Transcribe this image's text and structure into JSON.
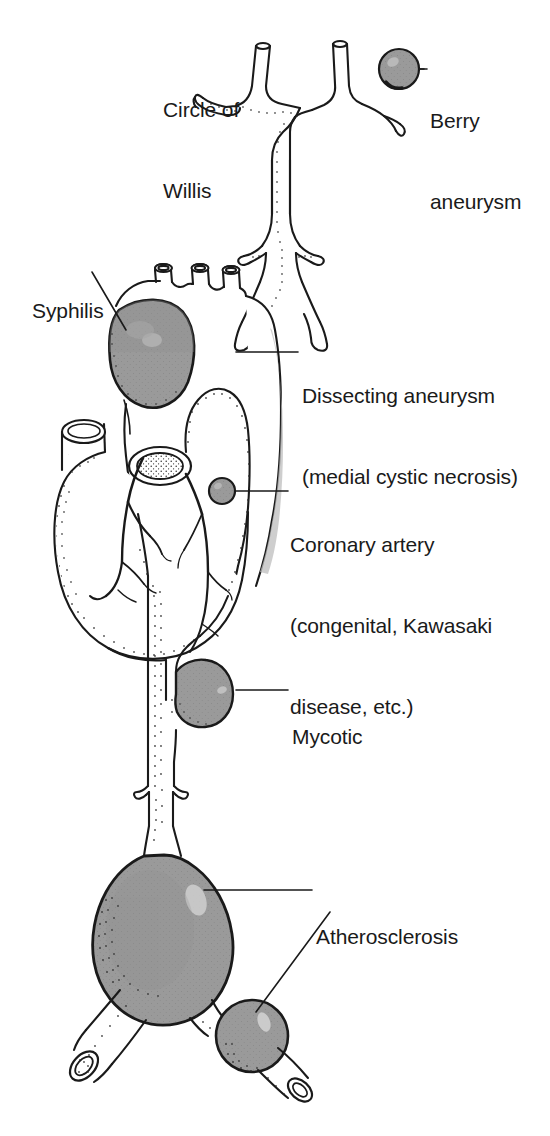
{
  "figure": {
    "background_color": "#ffffff",
    "ink_color": "#1a1a1a",
    "aneurysm_fill_color": "#9a9a9a",
    "vessel_fill_color": "#ffffff",
    "width": 550,
    "height": 1136
  },
  "labels": {
    "circle_of_willis": {
      "line1": "Circle of",
      "line2": "Willis"
    },
    "berry_aneurysm": {
      "line1": "Berry",
      "line2": "aneurysm"
    },
    "syphilis": {
      "line1": "Syphilis"
    },
    "dissecting_aneurysm": {
      "line1": "Dissecting aneurysm",
      "line2": "(medial cystic necrosis)"
    },
    "coronary_artery": {
      "line1": "Coronary artery",
      "line2": "(congenital, Kawasaki",
      "line3": "disease, etc.)"
    },
    "mycotic": {
      "line1": "Mycotic"
    },
    "atherosclerosis": {
      "line1": "Atherosclerosis"
    }
  },
  "structures": [
    {
      "name": "circle-of-willis",
      "label": "Circle of Willis",
      "shaded": false
    },
    {
      "name": "berry-aneurysm",
      "label": "Berry aneurysm",
      "shaded": true
    },
    {
      "name": "syphilitic-aortic-aneurysm",
      "label": "Syphilis",
      "shaded": true
    },
    {
      "name": "aortic-arch-dissection",
      "label": "Dissecting aneurysm (medial cystic necrosis)",
      "shaded": false
    },
    {
      "name": "coronary-artery-aneurysm",
      "label": "Coronary artery (congenital, Kawasaki disease, etc.)",
      "shaded": true
    },
    {
      "name": "mycotic-aneurysm",
      "label": "Mycotic",
      "shaded": true
    },
    {
      "name": "abdominal-aortic-aneurysm",
      "label": "Atherosclerosis",
      "shaded": true
    },
    {
      "name": "iliac-artery-aneurysm",
      "label": "Atherosclerosis",
      "shaded": true
    },
    {
      "name": "heart",
      "label": "Heart",
      "shaded": false
    }
  ]
}
